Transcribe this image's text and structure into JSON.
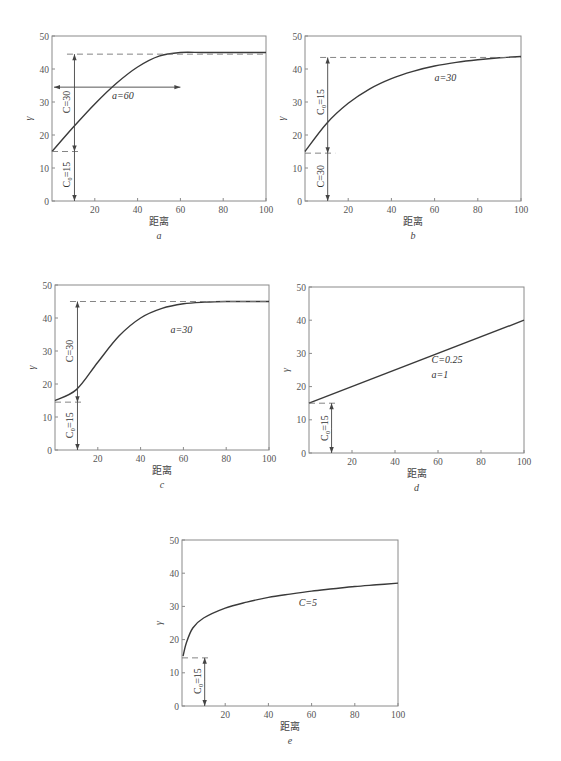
{
  "chart_data": [
    {
      "id": "a",
      "panel_label": "a",
      "type": "line",
      "title": "",
      "xlabel": "距离",
      "ylabel": "γ",
      "xlim": [
        0,
        100
      ],
      "ylim": [
        0,
        50
      ],
      "xticks": [
        20,
        40,
        60,
        80,
        100
      ],
      "yticks": [
        0,
        10,
        20,
        30,
        40,
        50
      ],
      "grid": false,
      "model": "spherical",
      "annotations": [
        "C=30",
        "C0=15",
        "a=60"
      ],
      "series": [
        {
          "name": "spherical",
          "x": [
            0,
            10,
            20,
            30,
            40,
            50,
            60,
            70,
            80,
            90,
            100
          ],
          "y": [
            15,
            22.4,
            29.4,
            35.6,
            40.6,
            43.9,
            45,
            45,
            45,
            45,
            45
          ]
        }
      ]
    },
    {
      "id": "b",
      "panel_label": "b",
      "type": "line",
      "xlabel": "距离",
      "ylabel": "γ",
      "xlim": [
        0,
        100
      ],
      "ylim": [
        0,
        50
      ],
      "xticks": [
        20,
        40,
        60,
        80,
        100
      ],
      "yticks": [
        0,
        10,
        20,
        30,
        40,
        50
      ],
      "grid": false,
      "model": "exponential",
      "annotations": [
        "C0=15",
        "C=30",
        "a=30"
      ],
      "series": [
        {
          "name": "exponential",
          "x": [
            0,
            10,
            20,
            30,
            40,
            50,
            60,
            70,
            80,
            90,
            100
          ],
          "y": [
            15,
            23.5,
            29.6,
            34,
            37.1,
            39.3,
            40.9,
            42,
            42.8,
            43.4,
            43.8
          ]
        }
      ]
    },
    {
      "id": "c",
      "panel_label": "c",
      "type": "line",
      "xlabel": "距离",
      "ylabel": "γ",
      "xlim": [
        0,
        100
      ],
      "ylim": [
        0,
        50
      ],
      "xticks": [
        20,
        40,
        60,
        80,
        100
      ],
      "yticks": [
        0,
        10,
        20,
        30,
        40,
        50
      ],
      "grid": false,
      "model": "gaussian",
      "annotations": [
        "C=30",
        "C0=15",
        "a=30"
      ],
      "series": [
        {
          "name": "gaussian",
          "x": [
            0,
            10,
            20,
            30,
            40,
            50,
            60,
            70,
            80,
            90,
            100
          ],
          "y": [
            15,
            18.3,
            26.6,
            34.6,
            40,
            42.9,
            44.3,
            44.8,
            45,
            45,
            45
          ]
        }
      ]
    },
    {
      "id": "d",
      "panel_label": "d",
      "type": "line",
      "xlabel": "距离",
      "ylabel": "γ",
      "xlim": [
        0,
        100
      ],
      "ylim": [
        0,
        50
      ],
      "xticks": [
        20,
        40,
        60,
        80,
        100
      ],
      "yticks": [
        0,
        10,
        20,
        30,
        40,
        50
      ],
      "grid": false,
      "model": "linear",
      "annotations": [
        "C=0.25",
        "a=1",
        "C0=15"
      ],
      "series": [
        {
          "name": "linear",
          "x": [
            0,
            100
          ],
          "y": [
            15,
            40
          ]
        }
      ]
    },
    {
      "id": "e",
      "panel_label": "e",
      "type": "line",
      "xlabel": "距离",
      "ylabel": "γ",
      "xlim": [
        0,
        100
      ],
      "ylim": [
        0,
        50
      ],
      "xticks": [
        20,
        40,
        60,
        80,
        100
      ],
      "yticks": [
        0,
        10,
        20,
        30,
        40,
        50
      ],
      "grid": false,
      "model": "logarithmic",
      "annotations": [
        "C=5",
        "C0=15"
      ],
      "series": [
        {
          "name": "logarithmic",
          "x": [
            0.5,
            2,
            5,
            10,
            20,
            30,
            40,
            50,
            60,
            70,
            80,
            90,
            100
          ],
          "y": [
            15,
            19,
            23.5,
            26.5,
            29.5,
            31.3,
            32.7,
            33.7,
            34.6,
            35.3,
            36,
            36.5,
            37
          ]
        }
      ]
    }
  ],
  "labels": {
    "xlabel": "距离",
    "ylabel": "γ",
    "panels": [
      "a",
      "b",
      "c",
      "d",
      "e"
    ],
    "a": {
      "c": "C=30",
      "c0": "C₀=15",
      "range": "a=60"
    },
    "b": {
      "c0": "C₀=15",
      "c": "C=30",
      "range": "a=30"
    },
    "c": {
      "c": "C=30",
      "c0": "C₀=15",
      "range": "a=30"
    },
    "d": {
      "c": "C=0.25",
      "range": "a=1",
      "c0": "C₀=15"
    },
    "e": {
      "c": "C=5",
      "c0": "C₀=15"
    }
  }
}
